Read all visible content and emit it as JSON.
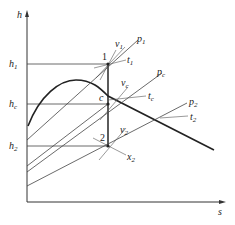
{
  "diagram": {
    "type": "h-s diagram (enthalpy-entropy)",
    "axes": {
      "y_label": "h",
      "x_label": "s"
    },
    "h_levels": [
      {
        "name": "h1",
        "base": "h",
        "sub": "1"
      },
      {
        "name": "hc",
        "base": "h",
        "sub": "c"
      },
      {
        "name": "h2",
        "base": "h",
        "sub": "2"
      }
    ],
    "points": [
      {
        "name": "1",
        "label": "1"
      },
      {
        "name": "c",
        "label": "c"
      },
      {
        "name": "2",
        "label": "2"
      }
    ],
    "isolines": {
      "p1": {
        "base": "p",
        "sub": "1"
      },
      "v1": {
        "base": "v",
        "sub": "1"
      },
      "t1": {
        "base": "t",
        "sub": "1"
      },
      "pc": {
        "base": "p",
        "sub": "c"
      },
      "vc": {
        "base": "v",
        "sub": "c"
      },
      "tc": {
        "base": "t",
        "sub": "c"
      },
      "p2": {
        "base": "p",
        "sub": "2"
      },
      "v2": {
        "base": "v",
        "sub": "2"
      },
      "t2": {
        "base": "t",
        "sub": "2"
      },
      "x2": {
        "base": "x",
        "sub": "2"
      }
    },
    "colors": {
      "line": "#333333",
      "background": "#ffffff"
    }
  }
}
